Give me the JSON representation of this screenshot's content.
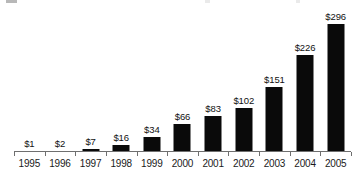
{
  "chart_data": {
    "type": "bar",
    "title": "",
    "subtitle": "",
    "xlabel": "",
    "ylabel": "",
    "categories": [
      "1995",
      "1996",
      "1997",
      "1998",
      "1999",
      "2000",
      "2001",
      "2002",
      "2003",
      "2004",
      "2005"
    ],
    "values": [
      1,
      2,
      7,
      16,
      34,
      66,
      83,
      102,
      151,
      226,
      296
    ],
    "data_labels": [
      "$1",
      "$2",
      "$7",
      "$16",
      "$34",
      "$66",
      "$83",
      "$102",
      "$151",
      "$226",
      "$296"
    ],
    "ylim": [
      0,
      320
    ],
    "grid": false,
    "legend": null,
    "bar_color": "#0a0a0a",
    "axis_color": "#6f6f6f",
    "background_color": "#ffffff",
    "text_color": "#111111",
    "annotations": []
  }
}
